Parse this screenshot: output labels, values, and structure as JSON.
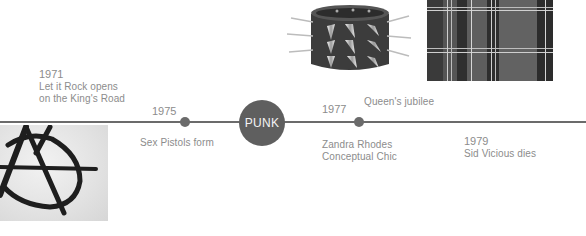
{
  "center_label": "PUNK",
  "events": [
    {
      "year": "1971",
      "line1": "Let it Rock opens",
      "line2": "on the King's Road"
    },
    {
      "year": "1975",
      "line1": "Sex Pistols form"
    },
    {
      "year": "1977",
      "line1": "Queen's jubilee"
    },
    {
      "year": "",
      "line1": "Zandra Rhodes",
      "line2": "Conceptual Chic"
    },
    {
      "year": "1979",
      "line1": "Sid Vicious dies"
    }
  ],
  "images": {
    "anarchy": "anarchy-symbol-image",
    "bracelet": "spiked-bracelet-image",
    "plaid": "tartan-plaid-image"
  },
  "colors": {
    "line": "#6b6b6b",
    "center_circle": "#5f5f5f",
    "text": "#8c8c8c"
  }
}
